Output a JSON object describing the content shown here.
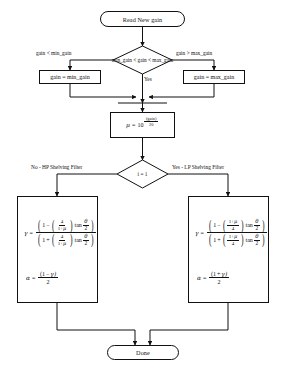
{
  "diagram": {
    "type": "flowchart",
    "stroke_color": "#111111",
    "background_color": "#ffffff"
  },
  "nodes": {
    "start": {
      "shape": "terminal",
      "label": "Read New gain"
    },
    "decision_range": {
      "shape": "diamond",
      "label": "min_gain < gain < max_gain"
    },
    "clamp_min": {
      "shape": "process",
      "label": "gain = min_gain"
    },
    "clamp_max": {
      "shape": "process",
      "label": "gain = max_gain"
    },
    "mu_compute": {
      "shape": "process",
      "mu_symbol": "μ",
      "equals": "=",
      "base": "10",
      "exponent_numerator": "(gain)",
      "exponent_denominator": "20"
    },
    "decision_filter": {
      "shape": "diamond",
      "label": "i = 1"
    },
    "hp_branch": {
      "shape": "process",
      "gamma_symbol": "γ",
      "alpha_symbol": "α",
      "equals": "=",
      "num_one": "1",
      "minus": "−",
      "plus": "+",
      "inner_num": "4",
      "inner_den_one": "1",
      "inner_den_plus": "+",
      "inner_den_mu": "μ",
      "tan": "tan",
      "theta": "θ",
      "two": "2",
      "alpha_num_left": "(1",
      "alpha_num_op": "−",
      "alpha_num_gamma": "γ)",
      "alpha_den": "2"
    },
    "lp_branch": {
      "shape": "process",
      "gamma_symbol": "γ",
      "alpha_symbol": "α",
      "equals": "=",
      "num_one": "1",
      "minus": "−",
      "plus": "+",
      "inner_num_one": "1",
      "inner_num_plus": "+",
      "inner_num_mu": "μ",
      "inner_den": "4",
      "tan": "tan",
      "theta": "θ",
      "two": "2",
      "alpha_num_left": "(1",
      "alpha_num_op": "+",
      "alpha_num_gamma": "γ)",
      "alpha_den": "2"
    },
    "end": {
      "shape": "terminal",
      "label": "Done"
    }
  },
  "edge_labels": {
    "branch_below_min": "gain < min_gain",
    "branch_above_max": "gain > max_gain",
    "branch_in_range": "Yes",
    "branch_hp": "No - HP Shelving Filter",
    "branch_lp": "Yes - LP Shelving Filter"
  }
}
